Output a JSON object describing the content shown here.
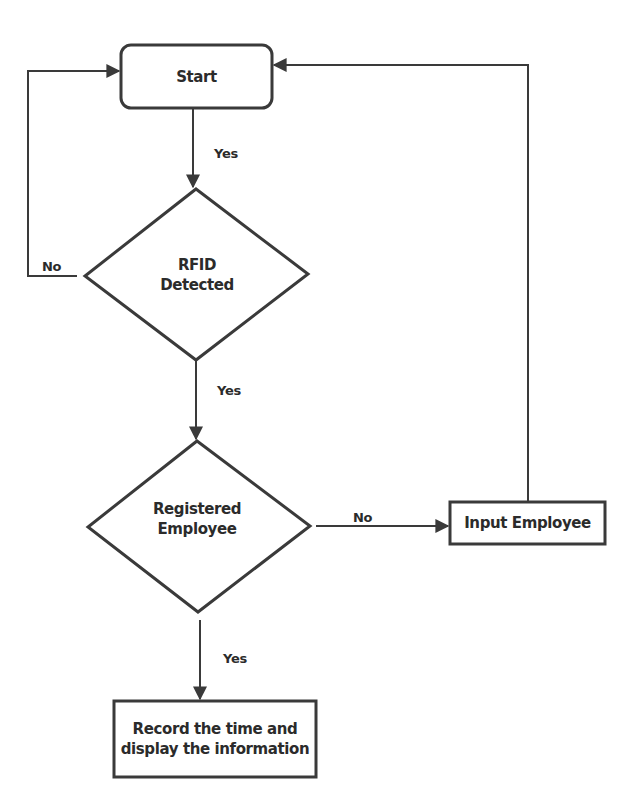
{
  "diagram": {
    "type": "flowchart",
    "colors": {
      "stroke": "#3a3a3a",
      "text": "#2b2b2b",
      "background": "#ffffff"
    },
    "nodes": {
      "start": {
        "shape": "rounded-rectangle",
        "label": "Start"
      },
      "rfid": {
        "shape": "diamond",
        "line1": "RFID",
        "line2": "Detected"
      },
      "registered": {
        "shape": "diamond",
        "line1": "Registered",
        "line2": "Employee"
      },
      "input_employee": {
        "shape": "rectangle",
        "label": "Input Employee"
      },
      "record": {
        "shape": "rectangle",
        "line1": "Record the time and",
        "line2": "display the information"
      }
    },
    "edges": {
      "start_to_rfid": {
        "from": "start",
        "to": "rfid",
        "label": "Yes"
      },
      "rfid_no": {
        "from": "rfid",
        "to": "start",
        "label": "No"
      },
      "rfid_to_registered": {
        "from": "rfid",
        "to": "registered",
        "label": "Yes"
      },
      "registered_no": {
        "from": "registered",
        "to": "input_employee",
        "label": "No"
      },
      "input_to_start": {
        "from": "input_employee",
        "to": "start",
        "label": ""
      },
      "registered_to_record": {
        "from": "registered",
        "to": "record",
        "label": "Yes"
      }
    }
  }
}
